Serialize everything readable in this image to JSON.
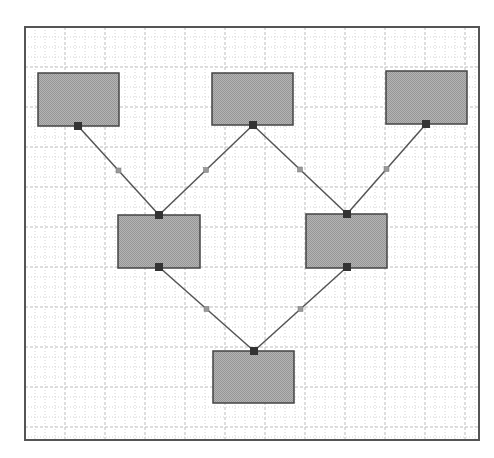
{
  "canvas": {
    "width": 494,
    "height": 458
  },
  "frame": {
    "x": 25,
    "y": 27,
    "w": 454,
    "h": 413,
    "border_color": "#555555"
  },
  "grid": {
    "minor_step": 10,
    "major_step": 40,
    "minor_color": "#d4d4d4",
    "major_color": "#bdbdbd"
  },
  "colors": {
    "node_fill": "#aaaaaa",
    "node_stroke": "#444444",
    "port": "#333333",
    "edge": "#555555",
    "midpoint": "#999999"
  },
  "nodes": [
    {
      "id": "node-1",
      "x": 38,
      "y": 73,
      "w": 81,
      "h": 53,
      "port_bottom": [
        78,
        126
      ]
    },
    {
      "id": "node-2",
      "x": 212,
      "y": 73,
      "w": 81,
      "h": 52,
      "port_bottom": [
        253,
        125
      ]
    },
    {
      "id": "node-3",
      "x": 386,
      "y": 71,
      "w": 81,
      "h": 53,
      "port_bottom": [
        426,
        124
      ]
    },
    {
      "id": "node-4",
      "x": 118,
      "y": 215,
      "w": 82,
      "h": 53,
      "port_top": [
        159,
        215
      ],
      "port_bottom": [
        159,
        267
      ]
    },
    {
      "id": "node-5",
      "x": 306,
      "y": 214,
      "w": 81,
      "h": 54,
      "port_top": [
        347,
        214
      ],
      "port_bottom": [
        347,
        267
      ]
    },
    {
      "id": "node-6",
      "x": 213,
      "y": 351,
      "w": 81,
      "h": 52,
      "port_top": [
        254,
        351
      ]
    }
  ],
  "edges": [
    {
      "from": "node-1",
      "to": "node-4",
      "x1": 78,
      "y1": 126,
      "x2": 159,
      "y2": 215
    },
    {
      "from": "node-2",
      "to": "node-4",
      "x1": 253,
      "y1": 125,
      "x2": 159,
      "y2": 215
    },
    {
      "from": "node-2",
      "to": "node-5",
      "x1": 253,
      "y1": 125,
      "x2": 347,
      "y2": 214
    },
    {
      "from": "node-3",
      "to": "node-5",
      "x1": 426,
      "y1": 124,
      "x2": 347,
      "y2": 214
    },
    {
      "from": "node-4",
      "to": "node-6",
      "x1": 159,
      "y1": 267,
      "x2": 254,
      "y2": 351
    },
    {
      "from": "node-5",
      "to": "node-6",
      "x1": 347,
      "y1": 267,
      "x2": 254,
      "y2": 351
    }
  ]
}
